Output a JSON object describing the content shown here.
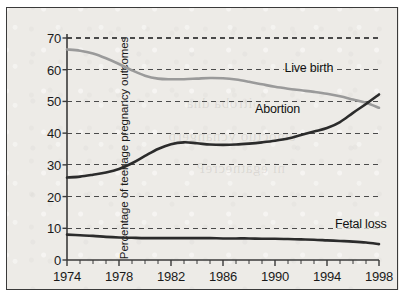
{
  "figure": {
    "background_color": "#edebe7",
    "frame_color": "#3a3a3a",
    "axis_title": "Percentage of teenage pregnancy outcomes"
  },
  "series_labels": {
    "live_birth": "Live birth",
    "abortion": "Abortion",
    "fetal_loss": "Fetal loss"
  },
  "chart_data": {
    "type": "line",
    "title": "",
    "subtitle": "",
    "xlabel": "",
    "ylabel": "Percentage of teenage pregnancy outcomes",
    "xlim": [
      1974,
      1998
    ],
    "ylim": [
      0,
      70
    ],
    "yticks": [
      0,
      10,
      20,
      30,
      40,
      50,
      60,
      70
    ],
    "xticks": [
      1974,
      1978,
      1982,
      1986,
      1990,
      1994,
      1998
    ],
    "xticks_minor_step": 1,
    "grid": "horizontal-dashed",
    "legend": "inline-labels",
    "x": [
      1974,
      1975,
      1976,
      1977,
      1978,
      1979,
      1980,
      1981,
      1982,
      1983,
      1984,
      1985,
      1986,
      1987,
      1988,
      1989,
      1990,
      1991,
      1992,
      1993,
      1994,
      1995,
      1996,
      1997,
      1998
    ],
    "series": [
      {
        "name": "Live birth",
        "color": "#9a9a9a",
        "values": [
          66.4,
          66.0,
          65.1,
          63.6,
          61.8,
          59.8,
          58.1,
          57.2,
          57.0,
          57.0,
          57.2,
          57.4,
          57.3,
          56.9,
          56.2,
          55.4,
          54.6,
          54.0,
          53.5,
          53.0,
          52.4,
          51.6,
          50.6,
          49.6,
          48.0
        ]
      },
      {
        "name": "Abortion",
        "color": "#2b2b2b",
        "values": [
          26.0,
          26.3,
          26.9,
          27.6,
          28.7,
          30.5,
          32.8,
          35.0,
          36.5,
          37.1,
          36.8,
          36.4,
          36.3,
          36.4,
          36.7,
          37.1,
          37.6,
          38.3,
          39.4,
          40.5,
          41.6,
          43.5,
          46.4,
          49.2,
          52.2
        ]
      },
      {
        "name": "Fetal loss",
        "color": "#2b2b2b",
        "values": [
          8.0,
          7.8,
          7.6,
          7.3,
          7.1,
          7.0,
          6.9,
          6.9,
          6.9,
          6.9,
          6.9,
          6.9,
          6.8,
          6.8,
          6.8,
          6.7,
          6.7,
          6.6,
          6.5,
          6.4,
          6.2,
          6.0,
          5.8,
          5.5,
          5.0
        ]
      }
    ],
    "annotations": [
      {
        "text": "Live birth",
        "x": 1992.6,
        "y": 60.5
      },
      {
        "text": "Abortion",
        "x": 1990.2,
        "y": 47.5
      },
      {
        "text": "Fetal loss",
        "x": 1996.6,
        "y": 11.2
      }
    ]
  },
  "showthrough_text": [
    {
      "text": "noitroba dna",
      "x": 186,
      "y": 95
    },
    {
      "text": "emoctuo ycnangerp",
      "x": 168,
      "y": 128
    },
    {
      "text": "ni egatnecreP",
      "x": 196,
      "y": 160
    }
  ]
}
